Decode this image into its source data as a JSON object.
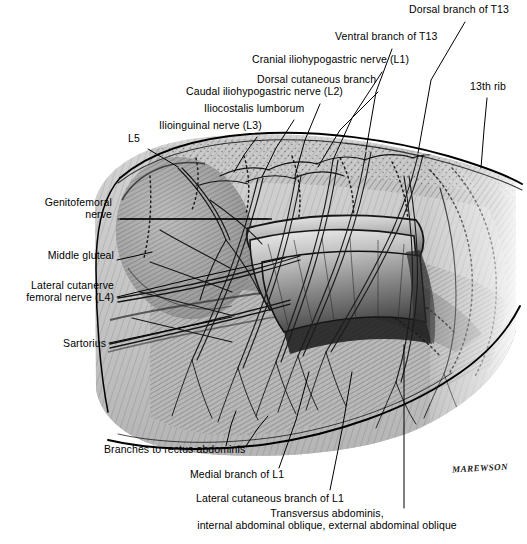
{
  "figure": {
    "signature": "MAREWSON",
    "palette": {
      "background": "#ffffff",
      "ink": "#000000",
      "muscle_light": "#c9c9c9",
      "muscle_mid": "#9a9a9a",
      "muscle_dark": "#5e5e5e",
      "shadow": "#3a3a3a",
      "highlight": "#e8e8e8"
    }
  },
  "labels": [
    {
      "id": "dorsal-branch-t13",
      "text": "Dorsal branch of T13",
      "align": "left",
      "x": 409,
      "y": 9,
      "leader": [
        [
          465,
          22
        ],
        [
          431,
          80
        ],
        [
          418,
          153
        ]
      ]
    },
    {
      "id": "ventral-branch-t13",
      "text": "Ventral branch of T13",
      "align": "left",
      "x": 335,
      "y": 36,
      "leader": [
        [
          392,
          49
        ],
        [
          376,
          92
        ],
        [
          366,
          150
        ]
      ]
    },
    {
      "id": "cranial-iliohypogastric-l1",
      "text": "Cranial iliohypogastric nerve (L1)",
      "align": "left",
      "x": 252,
      "y": 59,
      "leader": [
        [
          382,
          72
        ],
        [
          352,
          118
        ],
        [
          333,
          160
        ]
      ]
    },
    {
      "id": "dorsal-cutaneous-branch",
      "text": "Dorsal cutaneous branch",
      "align": "left",
      "x": 257,
      "y": 79,
      "leader": [
        [
          378,
          92
        ],
        [
          340,
          130
        ],
        [
          318,
          167
        ]
      ]
    },
    {
      "id": "caudal-iliohypogastric-l2",
      "text": "Caudal iliohypogastric nerve (L2)",
      "align": "left",
      "x": 186,
      "y": 91,
      "leader": [
        [
          320,
          104
        ],
        [
          305,
          140
        ],
        [
          295,
          176
        ]
      ]
    },
    {
      "id": "iliocostalis-lumborum",
      "text": "Iliocostalis lumborum",
      "align": "left",
      "x": 204,
      "y": 108,
      "leader": [
        [
          294,
          120
        ],
        [
          276,
          148
        ],
        [
          262,
          177
        ]
      ]
    },
    {
      "id": "ilioinguinal-l3",
      "text": "Ilioinguinal nerve (L3)",
      "align": "left",
      "x": 159,
      "y": 125,
      "leader": [
        [
          257,
          137
        ],
        [
          244,
          155
        ],
        [
          234,
          172
        ]
      ]
    },
    {
      "id": "l5",
      "text": "L5",
      "align": "left",
      "x": 128,
      "y": 138,
      "leader": [
        [
          148,
          149
        ],
        [
          163,
          158
        ],
        [
          178,
          167
        ]
      ]
    },
    {
      "id": "genitofemoral-nerve",
      "text": "Genitofemoral\nnerve",
      "align": "right",
      "x": 36,
      "y": 200,
      "leader": [
        [
          118,
          219
        ],
        [
          210,
          219
        ],
        [
          268,
          219
        ]
      ]
    },
    {
      "id": "middle-gluteal",
      "text": "Middle gluteal",
      "align": "right",
      "x": 36,
      "y": 255,
      "leader": [
        [
          117,
          260
        ],
        [
          135,
          256
        ],
        [
          152,
          252
        ]
      ]
    },
    {
      "id": "lateral-cutanerve-femoral-l4",
      "text": "Lateral cutanerve\nfemoral nerve (L4)",
      "align": "right",
      "x": 21,
      "y": 285,
      "leader": [
        [
          117,
          297
        ],
        [
          200,
          277
        ],
        [
          285,
          258
        ]
      ]
    },
    {
      "id": "sartorius",
      "text": "Sartorius",
      "align": "right",
      "x": 52,
      "y": 339,
      "leader": [
        [
          109,
          343
        ],
        [
          170,
          330
        ],
        [
          232,
          317
        ]
      ]
    },
    {
      "id": "branches-to-rectus-abdominis",
      "text": "Branches to rectus abdominis",
      "align": "left",
      "x": 104,
      "y": 448,
      "leader": [
        [
          226,
          446
        ],
        [
          231,
          425
        ],
        [
          236,
          411
        ]
      ],
      "leader2": [
        [
          246,
          446
        ],
        [
          258,
          428
        ],
        [
          268,
          416
        ]
      ]
    },
    {
      "id": "medial-branch-l1",
      "text": "Medial branch of L1",
      "align": "left",
      "x": 190,
      "y": 473,
      "leader": [
        [
          279,
          468
        ],
        [
          296,
          420
        ],
        [
          309,
          372
        ]
      ]
    },
    {
      "id": "lateral-cutaneous-branch-l1",
      "text": "Lateral cutaneous branch of L1",
      "align": "left",
      "x": 196,
      "y": 497,
      "leader": [
        [
          330,
          490
        ],
        [
          342,
          430
        ],
        [
          352,
          372
        ]
      ]
    },
    {
      "id": "transversus-abdominis-group",
      "text": "Transversus abdominis,\ninternal abdominal oblique, external abdominal oblique",
      "align": "center",
      "x": 152,
      "y": 510,
      "leader": [
        [
          404,
          508
        ],
        [
          404,
          440
        ],
        [
          404,
          345
        ]
      ]
    },
    {
      "id": "thirteenth-rib",
      "text": "13th rib",
      "align": "left",
      "x": 470,
      "y": 86,
      "leader": [
        [
          487,
          98
        ],
        [
          484,
          130
        ],
        [
          481,
          168
        ]
      ]
    }
  ],
  "label_text": {
    "dorsal_branch_t13": "Dorsal branch of T13",
    "ventral_branch_t13": "Ventral branch of T13",
    "cranial_iliohypogastric_l1": "Cranial iliohypogastric nerve (L1)",
    "dorsal_cutaneous_branch": "Dorsal cutaneous branch",
    "caudal_iliohypogastric_l2": "Caudal iliohypogastric nerve (L2)",
    "iliocostalis_lumborum": "Iliocostalis lumborum",
    "ilioinguinal_l3": "Ilioinguinal nerve (L3)",
    "l5": "L5",
    "genitofemoral_line1": "Genitofemoral",
    "genitofemoral_line2": "nerve",
    "middle_gluteal": "Middle gluteal",
    "lateral_cutanerve_line1": "Lateral cutanerve",
    "lateral_cutanerve_line2": "femoral nerve (L4)",
    "sartorius": "Sartorius",
    "branches_to_rectus_abdominis": "Branches to rectus abdominis",
    "medial_branch_l1": "Medial branch of L1",
    "lateral_cutaneous_branch_l1": "Lateral cutaneous branch of L1",
    "transversus_line1": "Transversus abdominis,",
    "transversus_line2": "internal abdominal oblique, external abdominal oblique",
    "thirteenth_rib": "13th rib",
    "signature": "MAREWSON"
  }
}
